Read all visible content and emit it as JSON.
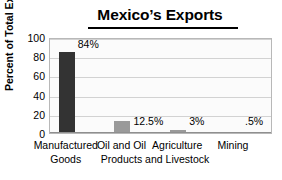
{
  "chart_data": {
    "type": "bar",
    "title": "Mexico’s Exports",
    "xlabel": "",
    "ylabel": "Percent of Total Exports",
    "ylim": [
      0,
      100
    ],
    "yticks": [
      100,
      80,
      60,
      40,
      20,
      0
    ],
    "grid": true,
    "legend": "none",
    "categories": [
      "Manufactured Goods",
      "Oil and Oil Products",
      "Agriculture and Livestock",
      "Mining"
    ],
    "category_lines": [
      [
        "Manufactured",
        "Goods"
      ],
      [
        "Oil and Oil",
        "Products"
      ],
      [
        "Agriculture",
        "and Livestock"
      ],
      [
        "Mining"
      ]
    ],
    "values": [
      84,
      12.5,
      3,
      0.5
    ],
    "value_labels": [
      "84%",
      "12.5%",
      "3%",
      ".5%"
    ],
    "bar_colors": [
      "#333333",
      "#9a9a9a",
      "#9a9a9a",
      "#9a9a9a"
    ],
    "plot_background": "#fbfbfb",
    "gridline_color": "#d2d2d2",
    "border_color": "#b8b8b8"
  }
}
